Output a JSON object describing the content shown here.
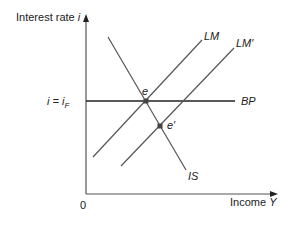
{
  "axes": {
    "y_label_text": "Interest rate ",
    "y_label_var": "i",
    "x_label_text": "Income ",
    "x_label_var": "Y",
    "origin": "0"
  },
  "level": {
    "label_left": "i = i",
    "label_sub": "F"
  },
  "curves": {
    "lm": "LM",
    "lm_prime": "LM′",
    "bp": "BP",
    "is": "IS"
  },
  "points": {
    "e": "e",
    "e_prime": "e′"
  },
  "colors": {
    "line": "#555555",
    "bp_line": "#222222",
    "text": "#222222",
    "point": "#444444"
  }
}
